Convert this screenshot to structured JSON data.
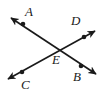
{
  "figure": {
    "type": "geometry-diagram",
    "background_color": "#ffffff",
    "stroke_color": "#1a1a1a",
    "stroke_width": 1.7,
    "point_radius": 2.3,
    "width": 102,
    "height": 101,
    "labels": {
      "A": "A",
      "B": "B",
      "C": "C",
      "D": "D",
      "E": "E"
    },
    "points": [
      {
        "name": "A",
        "x": 23,
        "y": 24
      },
      {
        "name": "B",
        "x": 81,
        "y": 66
      },
      {
        "name": "C",
        "x": 22,
        "y": 72
      },
      {
        "name": "D",
        "x": 84,
        "y": 37
      },
      {
        "name": "E",
        "x": 58,
        "y": 50
      }
    ],
    "lines": [
      {
        "name": "line-AB",
        "from": {
          "x": 11,
          "y": 18
        },
        "to": {
          "x": 96,
          "y": 74
        },
        "through": [
          "A",
          "E",
          "B"
        ],
        "arrows": "both"
      },
      {
        "name": "line-CD",
        "from": {
          "x": 8,
          "y": 79
        },
        "to": {
          "x": 95,
          "y": 31
        },
        "through": [
          "C",
          "E",
          "D"
        ],
        "arrows": "both"
      }
    ]
  }
}
